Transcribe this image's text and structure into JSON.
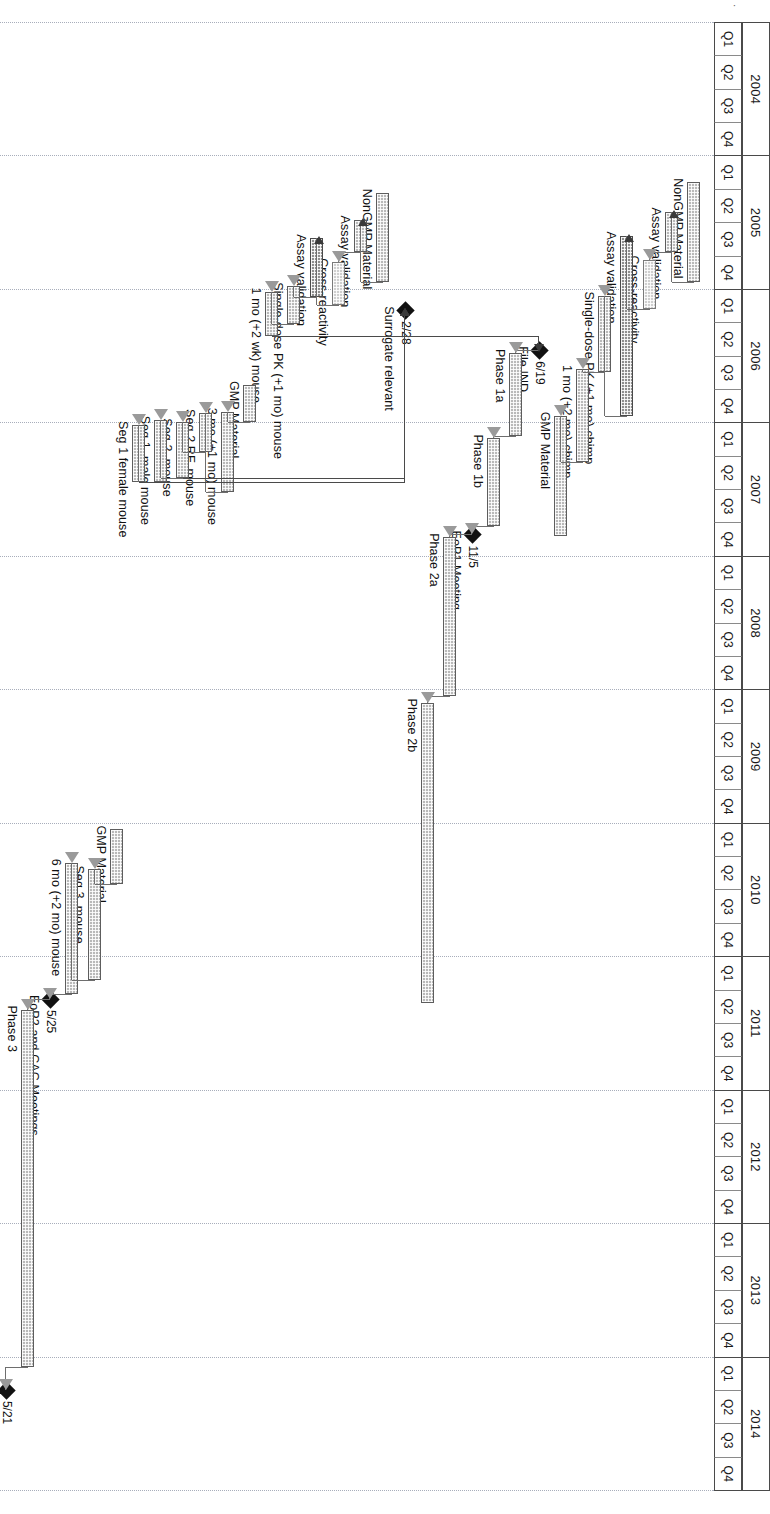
{
  "document": {
    "faint_title": "CONFIDENTIAL"
  },
  "chart_data": {
    "type": "gantt",
    "axis": {
      "label": "",
      "start_year": 2004,
      "end_year": 2014,
      "quarter_labels": [
        "Q1",
        "Q2",
        "Q3",
        "Q4"
      ],
      "years": [
        "2004",
        "2005",
        "2006",
        "2007",
        "2008",
        "2009",
        "2010",
        "2011",
        "2012",
        "2013",
        "2014"
      ],
      "grid": "dotted-vertical-per-year"
    },
    "tasks": [
      {
        "label": "NonGMP Material",
        "start": 2005.2,
        "end": 2005.95,
        "style": "normal"
      },
      {
        "label": "Assay validation",
        "start": 2005.42,
        "end": 2005.72,
        "style": "normal"
      },
      {
        "label": "Cross-reactivity",
        "start": 2005.78,
        "end": 2006.15,
        "style": "light"
      },
      {
        "label": "Assay validation",
        "start": 2005.6,
        "end": 2006.95,
        "style": "dark"
      },
      {
        "label": "Single-dose PK (+1 mo) chimp",
        "start": 2006.05,
        "end": 2006.62,
        "style": "normal"
      },
      {
        "label": "1 mo (+2 mo) chimp",
        "start": 2006.6,
        "end": 2007.3,
        "style": "normal"
      },
      {
        "label": "GMP Material",
        "start": 2006.95,
        "end": 2007.85,
        "style": "normal"
      },
      {
        "label": "File IND",
        "milestone": true,
        "date_label": "6/19",
        "at": 2006.46
      },
      {
        "label": "Phase 1a",
        "start": 2006.48,
        "end": 2007.1,
        "style": "normal"
      },
      {
        "label": "Phase 1b",
        "start": 2007.12,
        "end": 2007.78,
        "style": "normal"
      },
      {
        "label": "EoP1 Meeting",
        "milestone": true,
        "date_label": "11/5",
        "at": 2007.84
      },
      {
        "label": "Phase 2a",
        "start": 2007.86,
        "end": 2009.05,
        "style": "normal"
      },
      {
        "label": "Phase 2b",
        "start": 2009.1,
        "end": 2011.35,
        "style": "normal"
      },
      {
        "label": "Surrogate relevant",
        "milestone": true,
        "date_label": "2/28",
        "at": 2006.16
      },
      {
        "label": "NonGMP Material",
        "start": 2005.28,
        "end": 2005.95,
        "style": "normal"
      },
      {
        "label": "Assay validation",
        "start": 2005.48,
        "end": 2005.72,
        "style": "normal"
      },
      {
        "label": "Cross-reactivity",
        "start": 2005.8,
        "end": 2006.12,
        "style": "light"
      },
      {
        "label": "Assay validation",
        "start": 2005.62,
        "end": 2006.06,
        "style": "dark"
      },
      {
        "label": "Single-dose PK (+1 mo) mouse",
        "start": 2005.98,
        "end": 2006.26,
        "style": "normal"
      },
      {
        "label": "1 mo (+2 wk) mouse",
        "start": 2006.02,
        "end": 2006.35,
        "style": "normal"
      },
      {
        "label": "GMP Material",
        "start": 2006.72,
        "end": 2007.0,
        "style": "normal"
      },
      {
        "label": "3 mo (+1 mo) mouse",
        "start": 2006.92,
        "end": 2007.52,
        "style": "normal"
      },
      {
        "label": "Seg 2 RF, mouse",
        "start": 2006.93,
        "end": 2007.22,
        "style": "normal"
      },
      {
        "label": "Seg 2, mouse",
        "start": 2007.0,
        "end": 2007.42,
        "style": "normal"
      },
      {
        "label": "Seg 1, male mouse",
        "start": 2006.98,
        "end": 2007.45,
        "style": "normal"
      },
      {
        "label": "Seg 1 female mouse",
        "start": 2007.02,
        "end": 2007.45,
        "style": "normal"
      },
      {
        "label": "GMP Material",
        "start": 2010.05,
        "end": 2010.46,
        "style": "normal"
      },
      {
        "label": "Seg 3, mouse",
        "start": 2010.35,
        "end": 2011.18,
        "style": "normal"
      },
      {
        "label": "6 mo (+2 mo) mouse",
        "start": 2010.3,
        "end": 2011.28,
        "style": "normal"
      },
      {
        "label": "EoP2 and CAC Meetings",
        "milestone": true,
        "date_label": "5/25",
        "at": 2011.32
      },
      {
        "label": "Phase 3",
        "start": 2011.4,
        "end": 2014.08,
        "style": "normal"
      },
      {
        "label": "File BLA",
        "milestone": true,
        "date_label": "5/21",
        "at": 2014.25
      }
    ],
    "milestone_markers": [
      {
        "name": "File IND",
        "date_label": "6/19"
      },
      {
        "name": "Surrogate relevant",
        "date_label": "2/28"
      },
      {
        "name": "EoP1 Meeting",
        "date_label": "11/5"
      },
      {
        "name": "EoP2 and CAC Meetings",
        "date_label": "5/25"
      },
      {
        "name": "File BLA",
        "date_label": "5/21"
      }
    ],
    "colors": {
      "bar_fill": "#b9b9b9",
      "bar_fill_dark": "#8f8f8f",
      "bar_fill_light": "#cfcfcf",
      "bar_border": "#5d5d5d",
      "milestone": "#111111",
      "grid": "#9aa0b0",
      "text": "#1a1a1a"
    }
  }
}
